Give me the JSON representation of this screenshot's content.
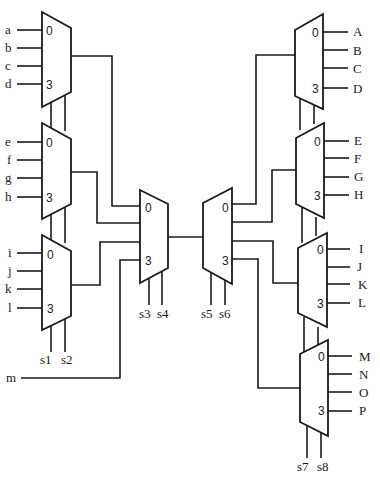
{
  "diagram": {
    "type": "multiplexer-demultiplexer network",
    "left_muxes": [
      {
        "id": "mux-a",
        "inputs": [
          "a",
          "b",
          "c",
          "d"
        ],
        "index_top": "0",
        "index_bottom": "3"
      },
      {
        "id": "mux-e",
        "inputs": [
          "e",
          "f",
          "g",
          "h"
        ],
        "index_top": "0",
        "index_bottom": "3"
      },
      {
        "id": "mux-i",
        "inputs": [
          "i",
          "j",
          "k",
          "l"
        ],
        "index_top": "0",
        "index_bottom": "3"
      }
    ],
    "left_selects": [
      "s1",
      "s2"
    ],
    "extra_input": "m",
    "center_mux": {
      "index_top": "0",
      "index_bottom": "3",
      "selects": [
        "s3",
        "s4"
      ]
    },
    "center_demux": {
      "index_top": "0",
      "index_bottom": "3",
      "selects": [
        "s5",
        "s6"
      ]
    },
    "right_demuxes": [
      {
        "id": "demux-A",
        "outputs": [
          "A",
          "B",
          "C",
          "D"
        ],
        "index_top": "0",
        "index_bottom": "3"
      },
      {
        "id": "demux-E",
        "outputs": [
          "E",
          "F",
          "G",
          "H"
        ],
        "index_top": "0",
        "index_bottom": "3"
      },
      {
        "id": "demux-I",
        "outputs": [
          "I",
          "J",
          "K",
          "L"
        ],
        "index_top": "0",
        "index_bottom": "3"
      },
      {
        "id": "demux-M",
        "outputs": [
          "M",
          "N",
          "O",
          "P"
        ],
        "index_top": "0",
        "index_bottom": "3"
      }
    ],
    "right_selects": [
      "s7",
      "s8"
    ]
  }
}
